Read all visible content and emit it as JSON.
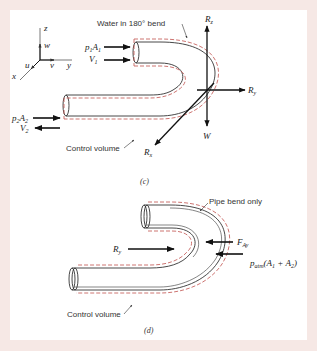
{
  "figure": {
    "background": "#f6e8e5",
    "panel_background": "#ffffff",
    "pipe_color": "#333333",
    "control_volume_color": "#c0504d",
    "arrow_color": "#111111"
  },
  "panel_c": {
    "caption": "(c)",
    "title_label": "Water in 180° bend",
    "control_volume_label": "Control volume",
    "axes": {
      "z": "z",
      "y": "y",
      "x": "x",
      "w": "w",
      "v": "v",
      "u": "u"
    },
    "inlet": {
      "force_label": "p",
      "force_sub": "1",
      "area_label": "A",
      "area_sub": "1",
      "velocity_label": "V",
      "velocity_sub": "1"
    },
    "outlet": {
      "force_label": "p",
      "force_sub": "2",
      "area_label": "A",
      "area_sub": "2",
      "velocity_label": "V",
      "velocity_sub": "2"
    },
    "reactions": {
      "rz_label": "R",
      "rz_sub": "z",
      "ry_label": "R",
      "ry_sub": "y",
      "rx_label": "R",
      "rx_sub": "x",
      "weight_label": "W"
    }
  },
  "panel_d": {
    "caption": "(d)",
    "title_label": "Pipe bend only",
    "control_volume_label": "Control volume",
    "ry_label": "R",
    "ry_sub": "y",
    "fay_label": "F",
    "fay_sub": "Ay",
    "patm_label": "p",
    "patm_sub": "atm",
    "patm_tail": "(A",
    "patm_a1_sub": "1",
    "patm_plus": " + A",
    "patm_a2_sub": "2",
    "patm_close": ")"
  }
}
